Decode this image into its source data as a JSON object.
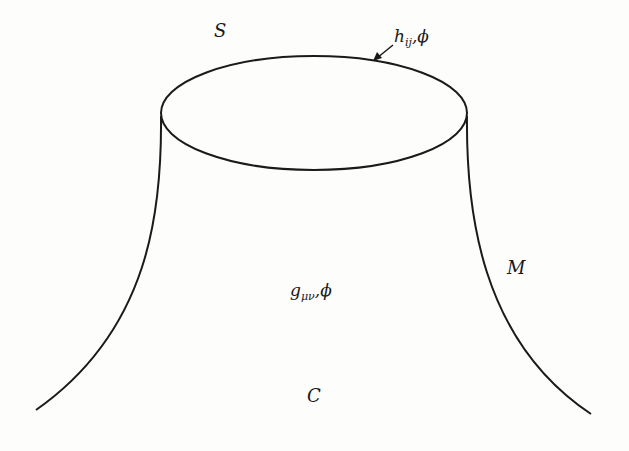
{
  "diagram": {
    "type": "manifold-with-boundary",
    "labels": {
      "boundary": "S",
      "boundary_fields_h": "h",
      "boundary_fields_h_sub": "ij",
      "boundary_fields_rest": ",ϕ",
      "manifold": "M",
      "bulk_fields_g": "g",
      "bulk_fields_g_sub": "μν",
      "bulk_fields_rest": ",ϕ",
      "bottom": "C"
    },
    "stroke_color": "#1a1a1a",
    "background": "#fdfdfc"
  }
}
